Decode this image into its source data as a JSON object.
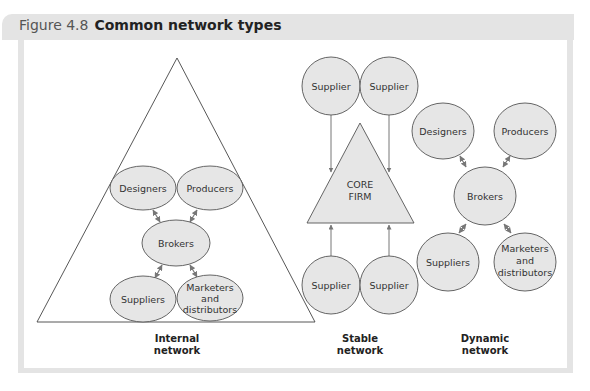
{
  "figure": {
    "number": "Figure 4.8",
    "title": "Common network types"
  },
  "colors": {
    "node_fill": "#e6e6e6",
    "node_stroke": "#555555",
    "edge": "#777777",
    "frame": "#e4e4e4"
  },
  "networks": {
    "internal": {
      "caption_line1": "Internal",
      "caption_line2": "network",
      "nodes": {
        "designers": "Designers",
        "producers": "Producers",
        "brokers": "Brokers",
        "suppliers": "Suppliers",
        "marketers_l1": "Marketers",
        "marketers_l2": "and",
        "marketers_l3": "distributors"
      }
    },
    "stable": {
      "caption_line1": "Stable",
      "caption_line2": "network",
      "core_l1": "CORE",
      "core_l2": "FIRM",
      "suppliers": [
        "Supplier",
        "Supplier",
        "Supplier",
        "Supplier"
      ]
    },
    "dynamic": {
      "caption_line1": "Dynamic",
      "caption_line2": "network",
      "nodes": {
        "designers": "Designers",
        "producers": "Producers",
        "brokers": "Brokers",
        "suppliers": "Suppliers",
        "marketers_l1": "Marketers",
        "marketers_l2": "and",
        "marketers_l3": "distributors"
      }
    }
  }
}
